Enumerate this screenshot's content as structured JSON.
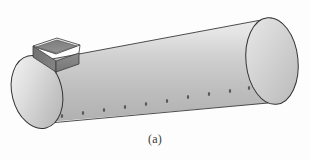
{
  "figure": {
    "caption": "(a)",
    "background_color": "#fdfdfd",
    "outline_color": "#2f2f2f",
    "body_gradient": {
      "light": "#e9e9e9",
      "mid": "#c9c9c9",
      "dark": "#a8a8a8"
    },
    "endcap_gradient": {
      "light": "#ececec",
      "mid": "#cfcfcf",
      "dark": "#b2b2b2"
    },
    "nozzle_colors": {
      "rim": "#efefef",
      "wall_dark": "#6e6e6e",
      "wall_mid": "#8a8a8a",
      "wall_light": "#b4b4b4"
    },
    "rivet_color": "#5a5a5a",
    "shapes": {
      "cylinder_label": "cylinder-body",
      "left_end_label": "left-end-cap",
      "right_end_label": "right-end-cap",
      "nozzle_label": "rectangular-nozzle",
      "seam_label": "bottom-seam-line"
    },
    "rivets": [
      {
        "x": 62,
        "y": 119
      },
      {
        "x": 83,
        "y": 116
      },
      {
        "x": 104,
        "y": 113
      },
      {
        "x": 125,
        "y": 110
      },
      {
        "x": 146,
        "y": 107
      },
      {
        "x": 167,
        "y": 104
      },
      {
        "x": 188,
        "y": 100
      },
      {
        "x": 209,
        "y": 97
      },
      {
        "x": 230,
        "y": 94
      },
      {
        "x": 249,
        "y": 91
      }
    ]
  }
}
